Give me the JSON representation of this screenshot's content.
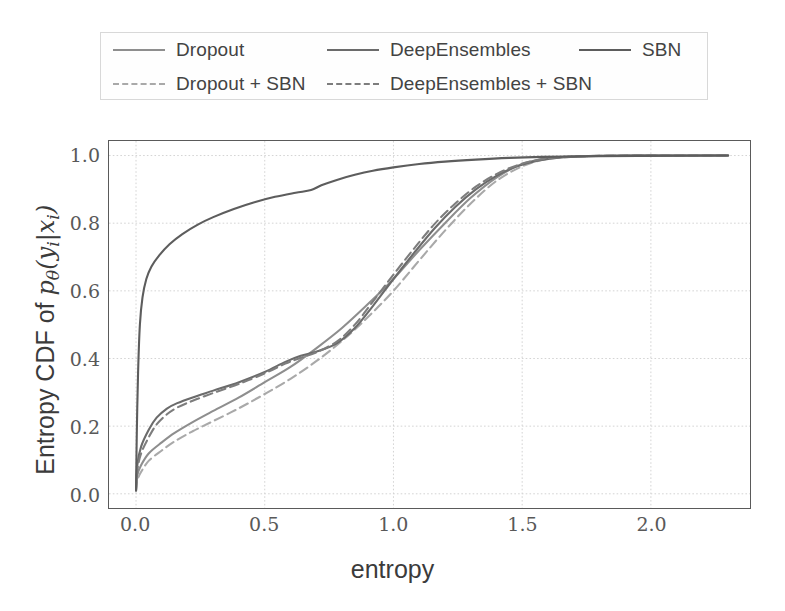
{
  "chart_data": {
    "type": "line",
    "title": "",
    "xlabel": "entropy",
    "ylabel": "Entropy CDF of p_theta(y_i|x_i)",
    "xlim": [
      -0.105,
      2.385
    ],
    "ylim": [
      -0.042,
      1.043
    ],
    "xticks": [
      "0.0",
      "0.5",
      "1.0",
      "1.5",
      "2.0"
    ],
    "xtick_values": [
      0.0,
      0.5,
      1.0,
      1.5,
      2.0
    ],
    "yticks": [
      "0.0",
      "0.2",
      "0.4",
      "0.6",
      "0.8",
      "1.0"
    ],
    "ytick_values": [
      0.0,
      0.2,
      0.4,
      0.6,
      0.8,
      1.0
    ],
    "grid": true,
    "legend_position": "above-axes",
    "series": [
      {
        "name": "Dropout",
        "style": "solid",
        "color": "#8e8e8e",
        "points": [
          [
            0.0,
            0.01
          ],
          [
            0.005,
            0.055
          ],
          [
            0.02,
            0.085
          ],
          [
            0.05,
            0.12
          ],
          [
            0.1,
            0.152
          ],
          [
            0.15,
            0.18
          ],
          [
            0.22,
            0.212
          ],
          [
            0.3,
            0.245
          ],
          [
            0.4,
            0.285
          ],
          [
            0.5,
            0.33
          ],
          [
            0.6,
            0.375
          ],
          [
            0.7,
            0.43
          ],
          [
            0.8,
            0.49
          ],
          [
            0.9,
            0.56
          ],
          [
            1.0,
            0.635
          ],
          [
            1.1,
            0.72
          ],
          [
            1.2,
            0.8
          ],
          [
            1.3,
            0.875
          ],
          [
            1.4,
            0.935
          ],
          [
            1.5,
            0.975
          ],
          [
            1.6,
            0.992
          ],
          [
            1.75,
            0.998
          ],
          [
            1.95,
            1.0
          ],
          [
            2.3,
            1.0
          ]
        ]
      },
      {
        "name": "Dropout + SBN",
        "style": "dashed",
        "color": "#a9a9a9",
        "points": [
          [
            0.0,
            0.008
          ],
          [
            0.005,
            0.04
          ],
          [
            0.02,
            0.065
          ],
          [
            0.05,
            0.098
          ],
          [
            0.1,
            0.128
          ],
          [
            0.15,
            0.155
          ],
          [
            0.22,
            0.185
          ],
          [
            0.3,
            0.215
          ],
          [
            0.4,
            0.253
          ],
          [
            0.5,
            0.295
          ],
          [
            0.6,
            0.34
          ],
          [
            0.7,
            0.392
          ],
          [
            0.8,
            0.452
          ],
          [
            0.9,
            0.522
          ],
          [
            1.0,
            0.6
          ],
          [
            1.1,
            0.69
          ],
          [
            1.2,
            0.778
          ],
          [
            1.3,
            0.858
          ],
          [
            1.4,
            0.925
          ],
          [
            1.5,
            0.968
          ],
          [
            1.6,
            0.99
          ],
          [
            1.75,
            0.998
          ],
          [
            1.95,
            1.0
          ],
          [
            2.3,
            1.0
          ]
        ]
      },
      {
        "name": "DeepEnsembles",
        "style": "solid",
        "color": "#6b6b6b",
        "points": [
          [
            0.0,
            0.015
          ],
          [
            0.005,
            0.085
          ],
          [
            0.02,
            0.14
          ],
          [
            0.05,
            0.19
          ],
          [
            0.08,
            0.225
          ],
          [
            0.12,
            0.252
          ],
          [
            0.16,
            0.268
          ],
          [
            0.22,
            0.285
          ],
          [
            0.3,
            0.305
          ],
          [
            0.4,
            0.33
          ],
          [
            0.5,
            0.36
          ],
          [
            0.58,
            0.39
          ],
          [
            0.64,
            0.408
          ],
          [
            0.7,
            0.42
          ],
          [
            0.78,
            0.445
          ],
          [
            0.85,
            0.49
          ],
          [
            0.92,
            0.555
          ],
          [
            1.0,
            0.635
          ],
          [
            1.08,
            0.712
          ],
          [
            1.16,
            0.785
          ],
          [
            1.24,
            0.848
          ],
          [
            1.32,
            0.9
          ],
          [
            1.4,
            0.94
          ],
          [
            1.48,
            0.968
          ],
          [
            1.56,
            0.985
          ],
          [
            1.66,
            0.995
          ],
          [
            1.8,
            0.999
          ],
          [
            2.05,
            1.0
          ],
          [
            2.3,
            1.0
          ]
        ]
      },
      {
        "name": "DeepEnsembles + SBN",
        "style": "dashed",
        "color": "#7d7d7d",
        "points": [
          [
            0.0,
            0.012
          ],
          [
            0.005,
            0.07
          ],
          [
            0.02,
            0.12
          ],
          [
            0.05,
            0.168
          ],
          [
            0.08,
            0.205
          ],
          [
            0.12,
            0.235
          ],
          [
            0.16,
            0.255
          ],
          [
            0.22,
            0.275
          ],
          [
            0.3,
            0.298
          ],
          [
            0.4,
            0.325
          ],
          [
            0.5,
            0.356
          ],
          [
            0.58,
            0.385
          ],
          [
            0.64,
            0.402
          ],
          [
            0.7,
            0.418
          ],
          [
            0.78,
            0.45
          ],
          [
            0.85,
            0.5
          ],
          [
            0.92,
            0.568
          ],
          [
            1.0,
            0.648
          ],
          [
            1.08,
            0.725
          ],
          [
            1.16,
            0.798
          ],
          [
            1.24,
            0.858
          ],
          [
            1.32,
            0.908
          ],
          [
            1.4,
            0.945
          ],
          [
            1.48,
            0.971
          ],
          [
            1.56,
            0.987
          ],
          [
            1.66,
            0.996
          ],
          [
            1.8,
            0.999
          ],
          [
            2.05,
            1.0
          ],
          [
            2.3,
            1.0
          ]
        ]
      },
      {
        "name": "SBN",
        "style": "solid",
        "color": "#5d5d5d",
        "points": [
          [
            0.0,
            0.01
          ],
          [
            0.003,
            0.18
          ],
          [
            0.008,
            0.36
          ],
          [
            0.015,
            0.5
          ],
          [
            0.025,
            0.58
          ],
          [
            0.04,
            0.635
          ],
          [
            0.06,
            0.672
          ],
          [
            0.09,
            0.705
          ],
          [
            0.13,
            0.738
          ],
          [
            0.18,
            0.768
          ],
          [
            0.24,
            0.796
          ],
          [
            0.3,
            0.818
          ],
          [
            0.38,
            0.842
          ],
          [
            0.46,
            0.862
          ],
          [
            0.54,
            0.878
          ],
          [
            0.62,
            0.89
          ],
          [
            0.68,
            0.898
          ],
          [
            0.72,
            0.912
          ],
          [
            0.78,
            0.928
          ],
          [
            0.85,
            0.943
          ],
          [
            0.92,
            0.955
          ],
          [
            1.0,
            0.965
          ],
          [
            1.1,
            0.975
          ],
          [
            1.2,
            0.982
          ],
          [
            1.32,
            0.988
          ],
          [
            1.45,
            0.993
          ],
          [
            1.58,
            0.996
          ],
          [
            1.75,
            0.998
          ],
          [
            1.95,
            0.999
          ],
          [
            2.3,
            1.0
          ]
        ]
      }
    ]
  },
  "legend": {
    "entries": [
      {
        "label": "Dropout",
        "style": "solid",
        "color": "#8e8e8e"
      },
      {
        "label": "DeepEnsembles",
        "style": "solid",
        "color": "#6b6b6b"
      },
      {
        "label": "SBN",
        "style": "solid",
        "color": "#5d5d5d"
      },
      {
        "label": "Dropout + SBN",
        "style": "dashed",
        "color": "#a9a9a9"
      },
      {
        "label": "DeepEnsembles + SBN",
        "style": "dashed",
        "color": "#7d7d7d"
      }
    ]
  },
  "axes": {
    "xlabel": "entropy",
    "ylabel_prefix": "Entropy CDF of ",
    "ylabel_math_p": "p",
    "ylabel_math_theta": "θ",
    "ylabel_math_open": "(",
    "ylabel_math_y": "y",
    "ylabel_math_isub1": "i",
    "ylabel_math_bar": "|",
    "ylabel_math_x": "x",
    "ylabel_math_isub2": "i",
    "ylabel_math_close": ")"
  },
  "style": {
    "grid_color": "#d4d4d4",
    "frame_color": "#5a5a5a",
    "background": "#ffffff",
    "tick_label_color": "#595959",
    "axis_label_color": "#3b3b3b"
  }
}
